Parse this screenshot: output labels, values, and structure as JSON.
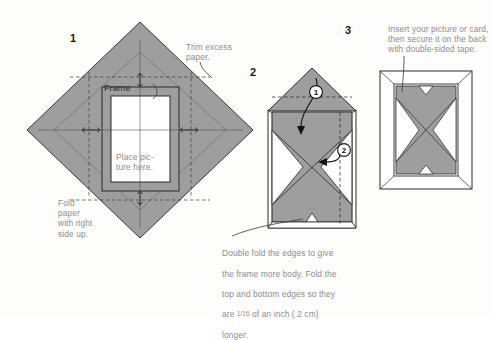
{
  "figure": {
    "background_color": "#fdfdfc",
    "paper_fill": "#9e9e9e",
    "paper_stroke": "#3a3a3a",
    "caption_color": "#8d8d8d",
    "white_fill": "#ffffff"
  },
  "steps": [
    {
      "number": "1",
      "labels": {
        "trim": "Trim excess\npaper.",
        "frame": "Frame",
        "place": "Place pic-\nture here.",
        "fold": "Fold\npaper\nwith right\nside up."
      }
    },
    {
      "number": "2",
      "fold_markers": [
        "1",
        "2"
      ],
      "caption_lines": [
        "Double fold the edges to give",
        "the frame more body. Fold the",
        "top and bottom edges so they",
        "are ",
        " of an inch (.2 cm)",
        "longer."
      ],
      "caption_fraction": "1/16",
      "caption": "Double fold the edges to give the frame more body. Fold the top and bottom edges so they are 1/16 of an inch (.2 cm) longer."
    },
    {
      "number": "3",
      "caption": "Insert your picture or card,\nthen secure it on the back\nwith double-sided tape."
    }
  ]
}
